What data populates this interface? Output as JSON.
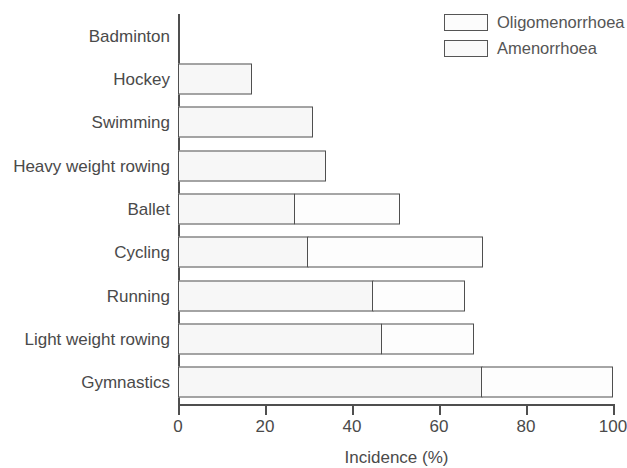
{
  "chart_data": {
    "type": "bar",
    "orientation": "horizontal",
    "stacked": true,
    "title": "",
    "xlabel": "Incidence (%)",
    "ylabel": "",
    "xlim": [
      0,
      100
    ],
    "xticks": [
      0,
      20,
      40,
      60,
      80,
      100
    ],
    "xtick_labels": [
      "0",
      "20",
      "40",
      "60",
      "80",
      "100"
    ],
    "grid": false,
    "legend_position": "top-right",
    "categories": [
      "Badminton",
      "Hockey",
      "Swimming",
      "Heavy weight rowing",
      "Ballet",
      "Cycling",
      "Running",
      "Light weight rowing",
      "Gymnastics"
    ],
    "series": [
      {
        "name": "Amenorrhoea",
        "values": [
          0,
          17,
          31,
          34,
          27,
          30,
          45,
          47,
          70
        ]
      },
      {
        "name": "Oligomenorrhoea",
        "values": [
          0,
          0,
          0,
          0,
          24,
          40,
          21,
          21,
          30
        ]
      }
    ],
    "totals": [
      0,
      17,
      31,
      34,
      51,
      70,
      66,
      68,
      100
    ]
  },
  "legend": {
    "items": [
      {
        "label": "Oligomenorrhoea",
        "swatch": "legend-swatch-oligomenorrhoea"
      },
      {
        "label": "Amenorrhoea",
        "swatch": "legend-swatch-amenorrhoea"
      }
    ]
  },
  "colors": {
    "bar_fill_amenorrhoea": "#f7f7f7",
    "bar_fill_oligomenorrhoea": "#fdfdfd",
    "bar_stroke": "#4f4f4f",
    "text": "#4a4a4a",
    "background": "#ffffff"
  }
}
